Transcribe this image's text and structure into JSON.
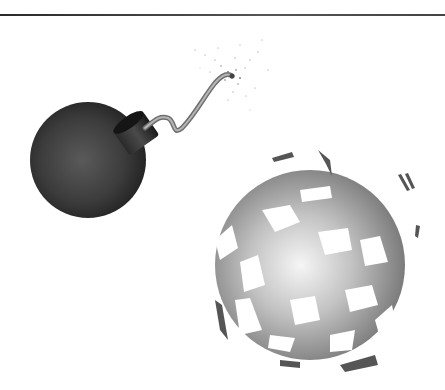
{
  "image": {
    "description": "Illustration of a black cartoon bomb with a lit fuse and a shattered exploding gray sphere",
    "caption": "",
    "subjects": [
      {
        "name": "bomb",
        "color": "#3a3a3a"
      },
      {
        "name": "fuse",
        "color": "#8a8a8a"
      },
      {
        "name": "sparks",
        "color": "#777777"
      },
      {
        "name": "shattered-sphere",
        "color": "#9a9a9a"
      }
    ],
    "colors": {
      "background": "#ffffff",
      "rule": "#333333"
    }
  }
}
